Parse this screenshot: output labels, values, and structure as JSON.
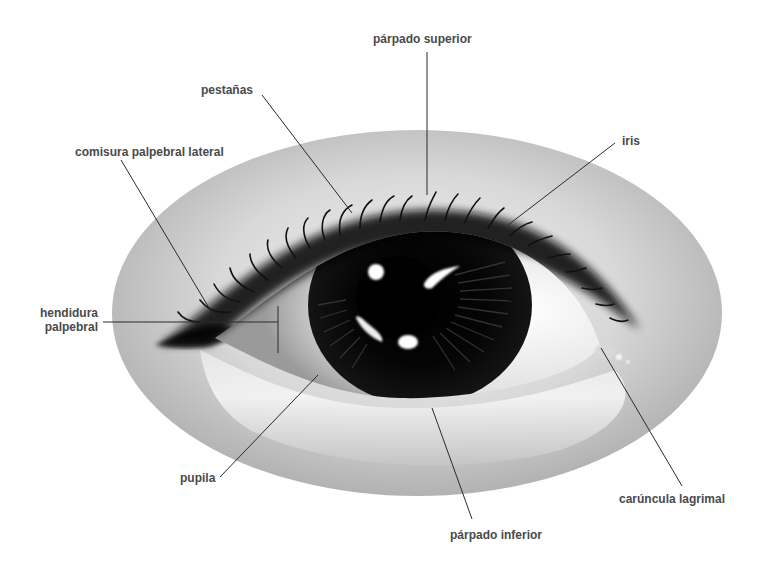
{
  "diagram": {
    "style": "grayscale illustration",
    "colors": {
      "background": "#ffffff",
      "label_text": "#4a4a4a",
      "leader_line": "#2a2a2a",
      "skin_light": "#f2f2f2",
      "skin_mid": "#bdbdbd",
      "iris": "#0a0a0a",
      "sclera": "#f7f7f7"
    },
    "labels": [
      {
        "id": "parpado-superior",
        "text": "párpado superior"
      },
      {
        "id": "pestanas",
        "text": "pestañas"
      },
      {
        "id": "comisura-palpebral-lateral",
        "text": "comisura palpebral lateral"
      },
      {
        "id": "iris",
        "text": "iris"
      },
      {
        "id": "hendidura-palpebral-1",
        "text": "hendidura"
      },
      {
        "id": "hendidura-palpebral-2",
        "text": "palpebral"
      },
      {
        "id": "pupila",
        "text": "pupila"
      },
      {
        "id": "caruncula-lagrimal",
        "text": "carúncula lagrimal"
      },
      {
        "id": "parpado-inferior",
        "text": "párpado inferior"
      }
    ]
  }
}
